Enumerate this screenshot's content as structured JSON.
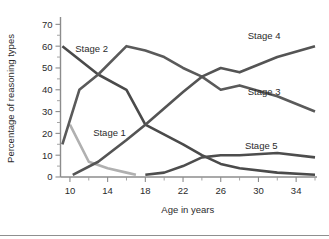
{
  "chart_data": {
    "type": "line",
    "title": "",
    "xlabel": "Age in years",
    "ylabel": "Percentage of reasoning types",
    "xlim": [
      9,
      36
    ],
    "ylim": [
      0,
      72
    ],
    "xticks": [
      10,
      14,
      18,
      22,
      26,
      30,
      34
    ],
    "xtick_labels": [
      "10",
      "14",
      "18",
      "22",
      "26",
      "30",
      "34"
    ],
    "xticks_minor": [
      12,
      16,
      20,
      24,
      28,
      32,
      36
    ],
    "yticks": [
      0,
      10,
      20,
      30,
      40,
      50,
      60,
      70
    ],
    "ytick_labels": [
      "0",
      "10",
      "20",
      "30",
      "40",
      "50",
      "60",
      "70"
    ],
    "yticks_minor": [
      5,
      15,
      25,
      35,
      45,
      55,
      65
    ],
    "grid": false,
    "legend_position": "inline-labels",
    "series": [
      {
        "name": "Stage 1",
        "color": "#b0b0b0",
        "label_x": 14.2,
        "label_y": 20.5,
        "x": [
          10,
          12,
          14,
          16,
          17
        ],
        "values": [
          24,
          7,
          4,
          2,
          1
        ]
      },
      {
        "name": "Stage 2",
        "color": "#4a4a4a",
        "label_x": 12.3,
        "label_y": 59,
        "x": [
          9.2,
          13,
          16,
          18,
          22,
          24,
          26,
          28,
          32,
          36
        ],
        "values": [
          60,
          47,
          40,
          24,
          15,
          10,
          6,
          4,
          2,
          1
        ]
      },
      {
        "name": "Stage 3",
        "color": "#5a5a5a",
        "label_x": 30.6,
        "label_y": 39,
        "x": [
          9.2,
          11,
          13,
          16,
          18,
          20,
          22,
          24,
          26,
          28,
          32,
          36
        ],
        "values": [
          15,
          40,
          47,
          60,
          58,
          55,
          50,
          46,
          40,
          42,
          37,
          30
        ]
      },
      {
        "name": "Stage 4",
        "color": "#545454",
        "label_x": 30.6,
        "label_y": 65,
        "x": [
          10.3,
          13,
          16,
          18,
          22,
          24,
          26,
          28,
          32,
          36
        ],
        "values": [
          1,
          7,
          17,
          24,
          39,
          46,
          50,
          48,
          55,
          60
        ]
      },
      {
        "name": "Stage 5",
        "color": "#4d4d4d",
        "label_x": 30.3,
        "label_y": 14.5,
        "x": [
          18,
          20,
          22,
          24,
          26,
          28,
          32,
          36
        ],
        "values": [
          1,
          2,
          5,
          9,
          10,
          10,
          11,
          9
        ]
      }
    ]
  }
}
